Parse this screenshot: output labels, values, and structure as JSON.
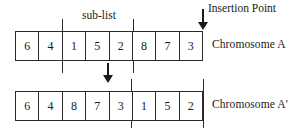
{
  "figure": {
    "sublist_label": "sub-list",
    "insertion_label": "Insertion Point"
  },
  "rows": [
    {
      "id": "chromosome-a",
      "label": "Chromosome A",
      "genes": [
        "6",
        "4",
        "1",
        "5",
        "2",
        "8",
        "7",
        "3"
      ]
    },
    {
      "id": "chromosome-a-prime",
      "label": "Chromosome A'",
      "genes": [
        "6",
        "4",
        "8",
        "7",
        "3",
        "1",
        "5",
        "2"
      ]
    }
  ],
  "colors": {
    "background": "#ffffff",
    "stroke": "#2a2a2a",
    "text": "#1a1a1a",
    "arrow": "#1a1a1a"
  }
}
